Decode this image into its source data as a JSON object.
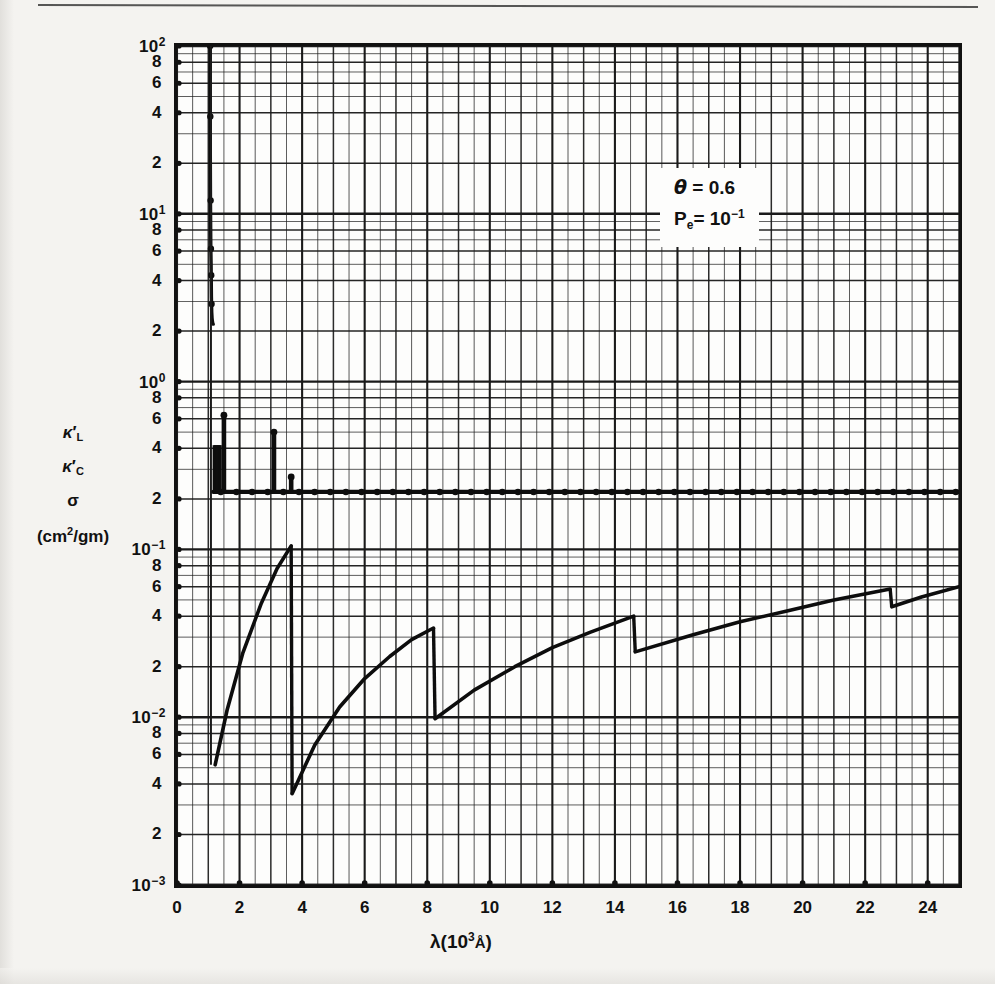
{
  "figure": {
    "annotation": {
      "line1_symbol": "θ",
      "line1_eq": "=",
      "line1_value": "0.6",
      "line2_symbol": "P",
      "line2_sub": "e",
      "line2_eq": "=",
      "line2_value": "10",
      "line2_exp": "−1"
    },
    "y_axis_title_lines": [
      "κ",
      "L",
      "κ",
      "C",
      "σ",
      "(cm",
      "2",
      "/gm)"
    ],
    "y_axis_title": {
      "l1_base": "κ",
      "l1_sub": "L",
      "l2_base": "κ",
      "l2_sub": "C",
      "l3": "σ",
      "l4_pre": "(cm",
      "l4_sup": "2",
      "l4_post": "/gm)"
    },
    "x_axis_title": {
      "lambda": "λ(",
      "ten": "10",
      "exp": "3",
      "angstrom": "Å",
      "close": ")"
    }
  },
  "chart_data": {
    "type": "line",
    "title": "",
    "xlabel": "λ(10³ Å)",
    "ylabel": "κ'_L , κ'_C , σ  (cm²/gm)",
    "xlim": [
      0,
      25
    ],
    "ylim": [
      0.001,
      100
    ],
    "yscale": "log",
    "xscale": "linear",
    "grid": true,
    "legend": null,
    "x_ticks": [
      0,
      2,
      4,
      6,
      8,
      10,
      12,
      14,
      16,
      18,
      20,
      22,
      24
    ],
    "x_tick_labels": [
      "0",
      "2",
      "4",
      "6",
      "8",
      "10",
      "12",
      "14",
      "16",
      "18",
      "20",
      "22",
      "24"
    ],
    "x_minor_step": 0.5,
    "y_decade_labels": [
      "10²",
      "10¹",
      "10⁰",
      "10⁻¹",
      "10⁻²",
      "10⁻³"
    ],
    "y_decades": [
      100,
      10,
      1,
      0.1,
      0.01,
      0.001
    ],
    "y_minor_labels": [
      "8",
      "6",
      "4",
      "2"
    ],
    "y_minor_values": [
      8,
      6,
      4,
      2
    ],
    "annotations": [
      {
        "text": "θ = 0.6",
        "x": 17.0,
        "y": 25.0
      },
      {
        "text": "P_e = 10⁻¹",
        "x": 17.0,
        "y": 14.0
      }
    ],
    "series": [
      {
        "name": "kappa_L (line absorption spike)",
        "style": "solid-dotted",
        "comment": "near-vertical Lyman spike at lambda ~= 1.05-1.15, descending from 1e2 to the plateau",
        "x": [
          1.06,
          1.06,
          1.07,
          1.08,
          1.09,
          1.1,
          1.11,
          1.12,
          1.13,
          1.14,
          1.15,
          1.16
        ],
        "y": [
          100,
          40,
          12,
          6.5,
          5.0,
          3.2,
          2.6,
          2.4,
          2.3,
          2.25,
          2.2,
          2.2
        ]
      },
      {
        "name": "sigma (flat electron-scattering plateau)",
        "style": "dotted-markers",
        "comment": "horizontal line at ~2.2 x 10^-1 across the whole range, marker dots every 0.5",
        "x": [
          1.2,
          2.0,
          3.0,
          4.0,
          5.0,
          6.0,
          7.0,
          8.0,
          9.0,
          10.0,
          11.0,
          12.0,
          13.0,
          14.0,
          15.0,
          16.0,
          17.0,
          18.0,
          19.0,
          20.0,
          21.0,
          22.0,
          23.0,
          24.0,
          25.0
        ],
        "y": [
          0.22,
          0.22,
          0.22,
          0.22,
          0.22,
          0.22,
          0.22,
          0.22,
          0.22,
          0.22,
          0.22,
          0.22,
          0.22,
          0.22,
          0.22,
          0.22,
          0.22,
          0.22,
          0.22,
          0.22,
          0.22,
          0.22,
          0.22,
          0.22,
          0.22
        ]
      },
      {
        "name": "line spikes above plateau",
        "style": "vertical-spikes",
        "comment": "narrow emission/absorption spikes rising off the plateau",
        "x": [
          1.5,
          3.1,
          3.65
        ],
        "y": [
          0.63,
          0.5,
          0.27
        ]
      },
      {
        "name": "kappa_C (continuous bound-free absorption, sawtooth)",
        "style": "solid",
        "comment": "four sawtooth ramps with vertical discontinuities at the ionization edges lambda = 3.65, 8.2, 14.6, 22.8",
        "segments": [
          {
            "edge": 3.65,
            "x": [
              1.22,
              1.6,
              2.1,
              2.7,
              3.2,
              3.65
            ],
            "y": [
              0.0052,
              0.011,
              0.024,
              0.048,
              0.077,
              0.105
            ]
          },
          {
            "edge": 8.2,
            "x": [
              3.68,
              4.4,
              5.2,
              6.0,
              6.8,
              7.5,
              8.2
            ],
            "y": [
              0.0035,
              0.0068,
              0.0115,
              0.017,
              0.023,
              0.029,
              0.034
            ]
          },
          {
            "edge": 14.6,
            "x": [
              8.25,
              9.5,
              10.8,
              12.0,
              13.2,
              14.6
            ],
            "y": [
              0.0098,
              0.0145,
              0.02,
              0.026,
              0.032,
              0.04
            ]
          },
          {
            "edge": 22.8,
            "x": [
              14.65,
              16.5,
              18.0,
              19.5,
              21.0,
              22.8
            ],
            "y": [
              0.0245,
              0.031,
              0.037,
              0.043,
              0.05,
              0.058
            ]
          },
          {
            "edge": 25.0,
            "x": [
              22.85,
              23.8,
              25.0
            ],
            "y": [
              0.0455,
              0.052,
              0.06
            ]
          }
        ]
      }
    ]
  }
}
